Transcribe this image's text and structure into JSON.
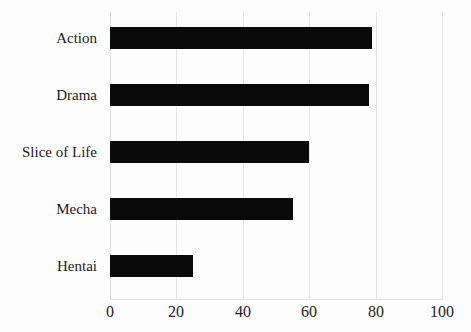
{
  "chart_data": {
    "type": "bar",
    "orientation": "horizontal",
    "title": "",
    "subtitle": "",
    "xlabel": "",
    "ylabel": "",
    "categories": [
      "Action",
      "Drama",
      "Slice of Life",
      "Mecha",
      "Hentai"
    ],
    "values": [
      79,
      78,
      60,
      55,
      25
    ],
    "series": [
      {
        "name": "",
        "values": [
          79,
          78,
          60,
          55,
          25
        ]
      }
    ],
    "xlim": [
      0,
      100
    ],
    "xticks": [
      0,
      20,
      40,
      60,
      80,
      100
    ],
    "xtick_labels": [
      "0",
      "20",
      "40",
      "60",
      "80",
      "100"
    ],
    "ytick_labels": [
      "Action",
      "Drama",
      "Slice of Life",
      "Mecha",
      "Hentai"
    ],
    "grid": true,
    "grid_axis": "x",
    "legend": false,
    "legend_position": "none",
    "annotations": [],
    "colors": {
      "bar": "#0a0a0a",
      "gridline": "#e9e9e9",
      "background": "#fdfdfd",
      "text": "#1c1c1c"
    }
  }
}
